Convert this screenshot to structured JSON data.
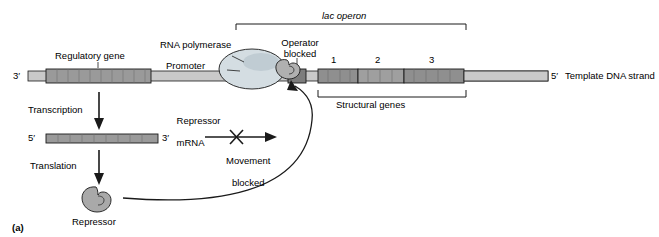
{
  "figure": {
    "panel_label": "(a)",
    "title_operon": "lac operon"
  },
  "labels": {
    "regulatory_gene": "Regulatory gene",
    "rna_polymerase": "RNA polymerase",
    "promoter": "Promoter",
    "operator_blocked": "Operator\nblocked",
    "structural_genes": "Structural genes",
    "template_dna_strand": "Template DNA strand",
    "transcription": "Transcription",
    "translation": "Translation",
    "repressor_mrna": "Repressor\nmRNA",
    "repressor": "Repressor",
    "movement_blocked": "Movement\nblocked"
  },
  "markers": {
    "dna_left_5prime": "3′",
    "dna_right_3prime": "5′",
    "mrna_left_5prime": "5′",
    "mrna_right_3prime": "3′",
    "gene_numbers": [
      "1",
      "2",
      "3"
    ]
  },
  "colors": {
    "dna_strand": "#b8b8b8",
    "regulatory_gene": "#9a9a9a",
    "structural_gene": "#8f8f8f",
    "mrna": "#9a9a9a",
    "polymerase": "#cfd8dc",
    "repressor": "#a8a8a8",
    "operator_band": "#7d7d7d",
    "outline": "#000000"
  }
}
